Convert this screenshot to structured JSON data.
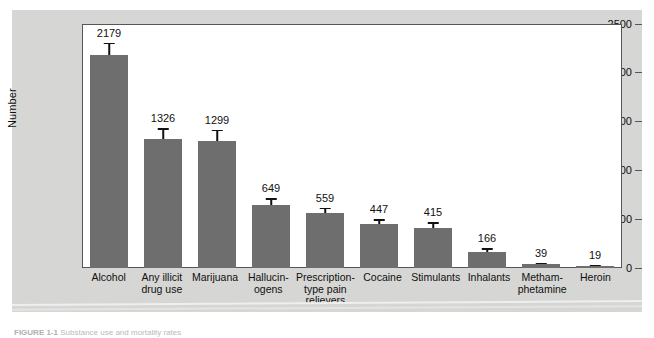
{
  "chart_data": {
    "type": "bar",
    "title": "",
    "xlabel": "",
    "ylabel": "Number",
    "ylim": [
      0,
      2500
    ],
    "yticks": [
      0,
      500,
      1000,
      1500,
      2000,
      2500
    ],
    "grid": false,
    "legend": null,
    "bar_color": "#6e6e6e",
    "error_bar_color": "#111111",
    "categories": [
      "Alcohol",
      "Any illicit drug use",
      "Marijuana",
      "Hallucinogens",
      "Prescription-type pain relievers",
      "Cocaine",
      "Stimulants",
      "Inhalants",
      "Methamphetamine",
      "Heroin"
    ],
    "category_lines": [
      [
        "Alcohol"
      ],
      [
        "Any illicit",
        "drug use"
      ],
      [
        "Marijuana"
      ],
      [
        "Hallucin-",
        "ogens"
      ],
      [
        "Prescription-",
        "type pain",
        "relievers"
      ],
      [
        "Cocaine"
      ],
      [
        "Stimulants"
      ],
      [
        "Inhalants"
      ],
      [
        "Metham-",
        "phetamine"
      ],
      [
        "Heroin"
      ]
    ],
    "values": [
      2179,
      1326,
      1299,
      649,
      559,
      447,
      415,
      166,
      39,
      19
    ],
    "value_labels": [
      "2179",
      "1326",
      "1299",
      "649",
      "559",
      "447",
      "415",
      "166",
      "39",
      "19"
    ],
    "error_low": [
      2050,
      1225,
      1190,
      580,
      500,
      390,
      355,
      125,
      22,
      8
    ],
    "error_high": [
      2310,
      1430,
      1415,
      715,
      620,
      500,
      470,
      205,
      56,
      30
    ]
  },
  "axis": {
    "y_label": "Number",
    "y_tick_labels": [
      "2500",
      "2000",
      "1500",
      "1000",
      "500",
      "0"
    ]
  },
  "caption": {
    "figure_number": "FIGURE 1-1",
    "text": "Substance use and mortality rates"
  }
}
